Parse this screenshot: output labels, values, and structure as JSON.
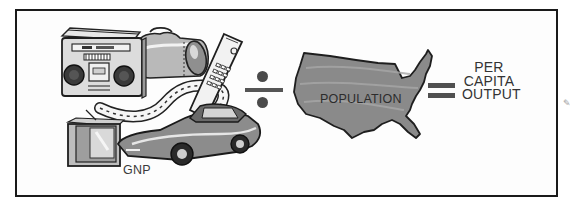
{
  "diagram": {
    "type": "equation-illustration",
    "equation": {
      "numerator": {
        "label": "GNP",
        "illustrated_items": [
          "boombox-radio",
          "duffel-bag",
          "cordless-phone",
          "highway-road",
          "television",
          "sports-car"
        ]
      },
      "operator_1": "divide",
      "denominator": {
        "label": "POPULATION",
        "illustration": "united-states-map"
      },
      "operator_2": "equals",
      "result": {
        "label_lines": [
          "PER",
          "CAPITA",
          "OUTPUT"
        ]
      }
    },
    "colors": {
      "border": "#1a1a1a",
      "text": "#3a3a3a",
      "map_fill": "#8a8a8a",
      "operator": "#505050"
    }
  }
}
